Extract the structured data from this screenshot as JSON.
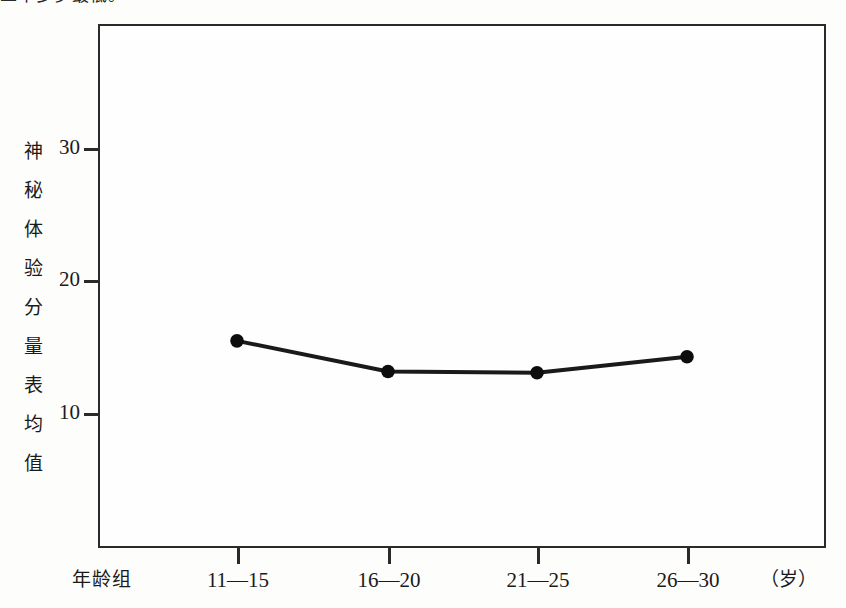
{
  "page": {
    "clipped_top_text": "二十多岁最低。"
  },
  "chart_data": {
    "type": "line",
    "title": "",
    "xlabel": "年龄组",
    "xunit": "（岁）",
    "ylabel": "神秘体验分量表均值",
    "ylabel_chars": [
      "神",
      "秘",
      "体",
      "验",
      "分",
      "量",
      "表",
      "均",
      "值"
    ],
    "categories": [
      "11—15",
      "16—20",
      "21—25",
      "26—30"
    ],
    "values": [
      15.5,
      13.2,
      13.1,
      14.3
    ],
    "series": [
      {
        "name": "神秘体验分量表均值",
        "values": [
          15.5,
          13.2,
          13.1,
          14.3
        ]
      }
    ],
    "yticks": [
      10,
      20,
      30
    ],
    "ytick_labels": [
      "10",
      "20",
      "30"
    ],
    "ylim": [
      0,
      38
    ],
    "xlim_categories": 4,
    "grid": false,
    "legend": "none",
    "marker": "filled-circle",
    "line_color": "#1a1a1a",
    "marker_color": "#0d0d0d",
    "frame_color": "#2a2a2a",
    "background_color": "#fefefe"
  }
}
